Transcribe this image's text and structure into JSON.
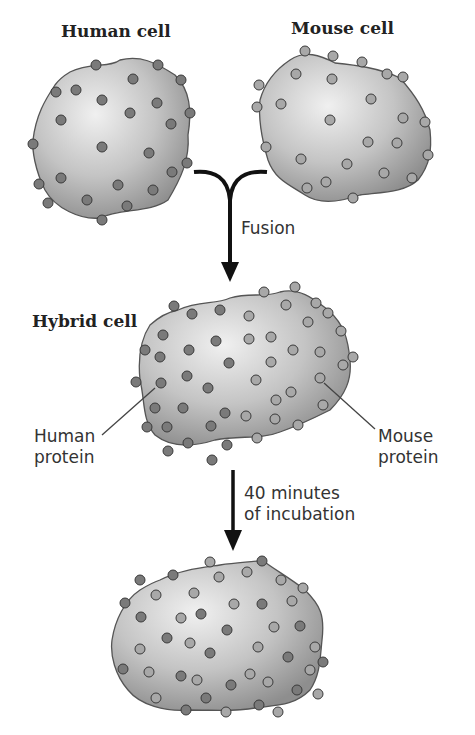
{
  "labels": {
    "human_cell": "Human cell",
    "mouse_cell": "Mouse cell",
    "fusion": "Fusion",
    "hybrid_cell": "Hybrid cell",
    "human_protein_line1": "Human",
    "human_protein_line2": "protein",
    "mouse_protein_line1": "Mouse",
    "mouse_protein_line2": "protein",
    "incubation_line1": "40 minutes",
    "incubation_line2": "of incubation"
  },
  "colors": {
    "cell_fill_light": "#e8e8e8",
    "cell_fill_dark": "#9a9a9a",
    "cell_outline": "#555555",
    "human_protein": "#7a7a7a",
    "mouse_protein": "#a8a8a8",
    "protein_outline": "#3a3a3a",
    "arrow": "#111111"
  },
  "stages": [
    {
      "name": "separate-cells",
      "cells": [
        "human",
        "mouse"
      ]
    },
    {
      "name": "hybrid-cell",
      "proteins": "segregated"
    },
    {
      "name": "after-incubation",
      "proteins": "intermixed"
    }
  ]
}
